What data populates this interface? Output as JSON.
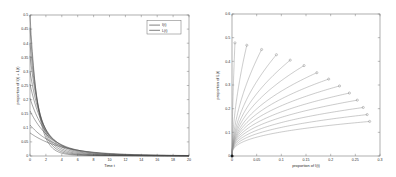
{
  "figure": {
    "panels": [
      "left-plot",
      "right-plot"
    ]
  },
  "chart_data": [
    {
      "id": "left-plot",
      "type": "line",
      "title": "",
      "xlabel": "Time t",
      "ylabel": "proportion of I(t) + L(t)",
      "xlim": [
        0,
        20
      ],
      "ylim": [
        0,
        0.5
      ],
      "xticks": [
        0,
        2,
        4,
        6,
        8,
        10,
        12,
        14,
        16,
        18,
        20
      ],
      "yticks": [
        0,
        0.05,
        0.1,
        0.15,
        0.2,
        0.25,
        0.3,
        0.35,
        0.4,
        0.45,
        0.5
      ],
      "grid": false,
      "legend": {
        "position": "top-right",
        "entries": [
          "I(t)",
          "L(t)"
        ]
      },
      "series": [
        {
          "name": "curve-1",
          "y0": 0.5,
          "rate": 1.05,
          "tail": 0.004
        },
        {
          "name": "curve-2",
          "y0": 0.455,
          "rate": 0.92,
          "tail": 0.005
        },
        {
          "name": "curve-3",
          "y0": 0.4,
          "rate": 0.8,
          "tail": 0.006
        },
        {
          "name": "curve-4",
          "y0": 0.355,
          "rate": 0.7,
          "tail": 0.007
        },
        {
          "name": "curve-5",
          "y0": 0.3,
          "rate": 0.6,
          "tail": 0.008
        },
        {
          "name": "curve-6",
          "y0": 0.255,
          "rate": 0.52,
          "tail": 0.009
        },
        {
          "name": "curve-7",
          "y0": 0.205,
          "rate": 0.45,
          "tail": 0.01
        },
        {
          "name": "curve-8",
          "y0": 0.16,
          "rate": 0.38,
          "tail": 0.011
        },
        {
          "name": "curve-9",
          "y0": 0.11,
          "rate": 0.32,
          "tail": 0.012
        },
        {
          "name": "curve-10",
          "y0": 0.082,
          "rate": 0.27,
          "tail": 0.013
        }
      ],
      "xlabel_ticktext": [
        "0",
        "2",
        "4",
        "6",
        "8",
        "10",
        "12",
        "14",
        "16",
        "18",
        "20"
      ],
      "ylabel_ticktext": [
        "0",
        "0.05",
        "0.1",
        "0.15",
        "0.2",
        "0.25",
        "0.3",
        "0.35",
        "0.4",
        "0.45",
        "0.5"
      ]
    },
    {
      "id": "right-plot",
      "type": "line",
      "title": "",
      "xlabel": "proportion of I(t)",
      "ylabel": "proportion of L(t)",
      "xlim": [
        0,
        0.3
      ],
      "ylim": [
        0,
        0.6
      ],
      "xticks": [
        0,
        0.05,
        0.1,
        0.15,
        0.2,
        0.25,
        0.3
      ],
      "yticks": [
        0,
        0.1,
        0.2,
        0.3,
        0.4,
        0.5,
        0.6
      ],
      "grid": false,
      "legend": null,
      "marker": "circle",
      "note": "trajectories radiating from origin, each terminating in an open circle marker",
      "series": [
        {
          "name": "traj-1",
          "end_x": 0.006,
          "end_y": 0.478,
          "bend": 0.1
        },
        {
          "name": "traj-2",
          "end_x": 0.03,
          "end_y": 0.468,
          "bend": 0.13
        },
        {
          "name": "traj-3",
          "end_x": 0.06,
          "end_y": 0.45,
          "bend": 0.16
        },
        {
          "name": "traj-4",
          "end_x": 0.09,
          "end_y": 0.428,
          "bend": 0.19
        },
        {
          "name": "traj-5",
          "end_x": 0.118,
          "end_y": 0.405,
          "bend": 0.22
        },
        {
          "name": "traj-6",
          "end_x": 0.146,
          "end_y": 0.382,
          "bend": 0.25
        },
        {
          "name": "traj-7",
          "end_x": 0.172,
          "end_y": 0.352,
          "bend": 0.28
        },
        {
          "name": "traj-8",
          "end_x": 0.196,
          "end_y": 0.325,
          "bend": 0.31
        },
        {
          "name": "traj-9",
          "end_x": 0.218,
          "end_y": 0.296,
          "bend": 0.34
        },
        {
          "name": "traj-10",
          "end_x": 0.238,
          "end_y": 0.266,
          "bend": 0.37
        },
        {
          "name": "traj-11",
          "end_x": 0.254,
          "end_y": 0.236,
          "bend": 0.4
        },
        {
          "name": "traj-12",
          "end_x": 0.266,
          "end_y": 0.205,
          "bend": 0.43
        },
        {
          "name": "traj-13",
          "end_x": 0.274,
          "end_y": 0.175,
          "bend": 0.46
        },
        {
          "name": "traj-14",
          "end_x": 0.279,
          "end_y": 0.146,
          "bend": 0.49
        }
      ],
      "xlabel_ticktext": [
        "0",
        "0.05",
        "0.1",
        "0.15",
        "0.2",
        "0.25",
        "0.3"
      ],
      "ylabel_ticktext": [
        "0",
        "0.1",
        "0.2",
        "0.3",
        "0.4",
        "0.5",
        "0.6"
      ]
    }
  ]
}
